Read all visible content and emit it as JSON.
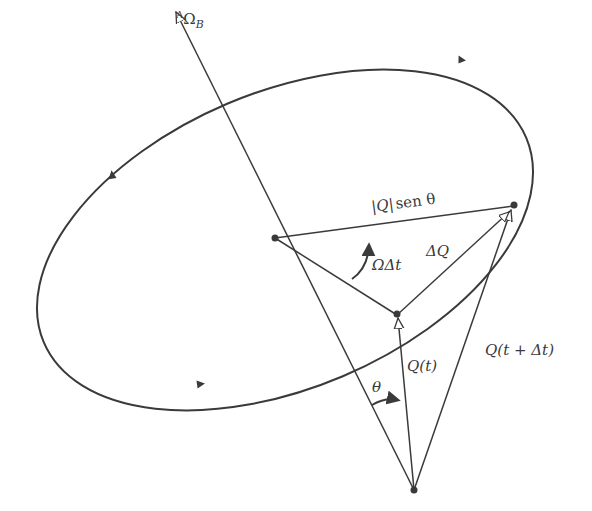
{
  "figure": {
    "type": "precession-cone-diagram",
    "colors": {
      "ink": "#3a3a3a",
      "background": "#ffffff"
    }
  },
  "labels": {
    "axis_superscript": "A",
    "axis_main": "Ω",
    "axis_subscript": "B",
    "chord_prefix": "|Q|",
    "chord_suffix": "sen θ",
    "rotation_angle": "ΩΔt",
    "delta_q": "ΔQ",
    "q_t": "Q(t)",
    "q_t_dt_main": "Q(t + Δt)",
    "theta": "θ"
  },
  "points": {
    "axis_tip": [
      176,
      12
    ],
    "center": [
      275,
      238
    ],
    "q_t_tip": [
      397,
      315
    ],
    "q_t_dt_tip": [
      513,
      206
    ],
    "origin": [
      414,
      490
    ]
  },
  "ellipse_direction_arrows": [
    "top-right",
    "left",
    "bottom"
  ]
}
